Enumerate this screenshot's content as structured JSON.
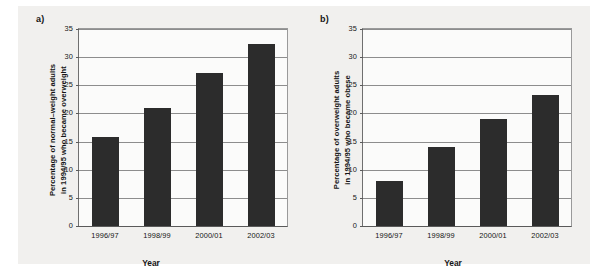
{
  "figure": {
    "background_color": "#f1f0ee",
    "bar_color": "#2c2c2c",
    "grid_color": "#8d8d8d",
    "axis_color": "#5a5a5a",
    "plot_background": "#fbfbfa"
  },
  "chart_data": [
    {
      "type": "bar",
      "panel_label": "a)",
      "title": "",
      "categories": [
        "1996/97",
        "1998/99",
        "2000/01",
        "2002/03"
      ],
      "values": [
        15.9,
        21.0,
        27.1,
        32.3
      ],
      "xlabel": "Year",
      "ylabel": "Percentage of normal–weight adults in 1994/95 who became overweight",
      "ylabel_lines": [
        "Percentage of normal–weight adults",
        "in 1994/95 who became overweight"
      ],
      "ylim": [
        0,
        35
      ],
      "yticks": [
        0,
        5,
        10,
        15,
        20,
        25,
        30,
        35
      ],
      "ytick_labels": [
        "0",
        "5",
        "10",
        "15",
        "20",
        "25",
        "30",
        "35"
      ],
      "grid": true,
      "legend": "none"
    },
    {
      "type": "bar",
      "panel_label": "b)",
      "title": "",
      "categories": [
        "1996/97",
        "1998/99",
        "2000/01",
        "2002/03"
      ],
      "values": [
        8.0,
        14.1,
        19.0,
        23.2
      ],
      "xlabel": "Year",
      "ylabel": "Percentage of overweight adults in 1994/95 who became obese",
      "ylabel_lines": [
        "Percentage of overweight adults",
        "in 1994/95 who became obese"
      ],
      "ylim": [
        0,
        35
      ],
      "yticks": [
        0,
        5,
        10,
        15,
        20,
        25,
        30,
        35
      ],
      "ytick_labels": [
        "0",
        "5",
        "10",
        "15",
        "20",
        "25",
        "30",
        "35"
      ],
      "grid": true,
      "legend": "none"
    }
  ]
}
